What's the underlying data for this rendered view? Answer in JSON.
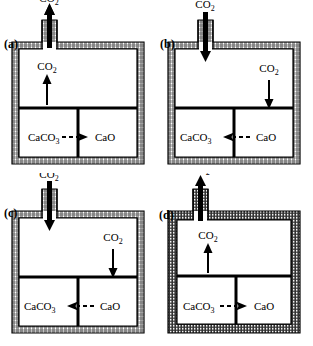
{
  "figure": {
    "panel_count": 4,
    "colors": {
      "stroke": "#000000",
      "background": "#ffffff",
      "wall_fill": "#c8c8c8"
    }
  },
  "labels": {
    "co2": "CO",
    "co2_sub": "2",
    "caco3": "CaCO",
    "caco3_sub": "3",
    "cao": "CaO"
  },
  "panels": [
    {
      "id": "a",
      "label": "(a)",
      "neck_position": "left",
      "neck_flow": "out",
      "neck_arrow_direction": "up",
      "neck_co2_label": "CO2",
      "inner_arrow_position": "left",
      "inner_arrow_direction": "up",
      "inner_co2_label": "CO2",
      "reaction_left": "CaCO3",
      "reaction_right": "CaO",
      "reaction_arrow_direction": "right",
      "reaction_arrow_style": "dashed",
      "wall_style": "hatched"
    },
    {
      "id": "b",
      "label": "(b)",
      "neck_position": "left",
      "neck_flow": "in",
      "neck_arrow_direction": "down",
      "neck_co2_label": "CO2",
      "inner_arrow_position": "right",
      "inner_arrow_direction": "down",
      "inner_co2_label": "CO2",
      "reaction_left": "CaCO3",
      "reaction_right": "CaO",
      "reaction_arrow_direction": "left",
      "reaction_arrow_style": "dashed",
      "wall_style": "hatched"
    },
    {
      "id": "c",
      "label": "(c)",
      "neck_position": "left",
      "neck_flow": "in",
      "neck_arrow_direction": "down",
      "neck_co2_label": "CO2",
      "inner_arrow_position": "right",
      "inner_arrow_direction": "down",
      "inner_co2_label": "CO2",
      "reaction_left": "CaCO3",
      "reaction_right": "CaO",
      "reaction_arrow_direction": "left",
      "reaction_arrow_style": "dashed",
      "wall_style": "hatched"
    },
    {
      "id": "d",
      "label": "(d)",
      "neck_position": "left",
      "neck_flow": "out",
      "neck_arrow_direction": "up",
      "neck_co2_label": "CO2",
      "inner_arrow_position": "left",
      "inner_arrow_direction": "up",
      "inner_co2_label": "CO2",
      "reaction_left": "CaCO3",
      "reaction_right": "CaO",
      "reaction_arrow_direction": "right",
      "reaction_arrow_style": "dashed",
      "wall_style": "hatched-dense"
    }
  ]
}
